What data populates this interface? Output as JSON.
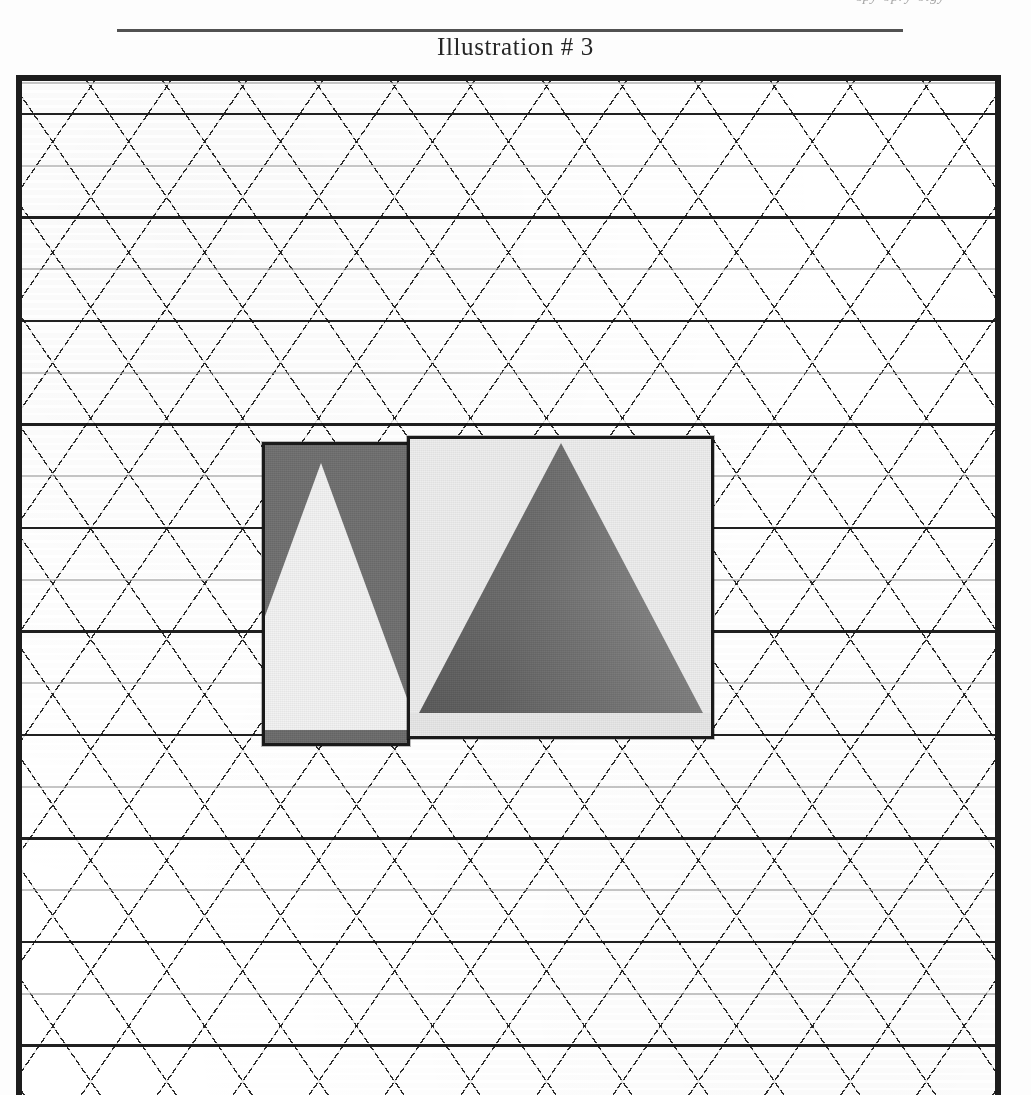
{
  "page": {
    "running_head": "spy-opry-olgy",
    "caption": "Illustration # 3",
    "caption_rule": "horizontal-rule"
  },
  "plate": {
    "name": "framed-illustration-plate",
    "border_color": "#1d1d1d",
    "background_color": "#ffffff",
    "pattern": {
      "type": "diamond-crosshatch-grid",
      "diagonal_line_color": "#1a1a1a",
      "horizontal_dark_line_color": "#141414",
      "horizontal_light_line_color": "#969696",
      "horizontal_dark_spacing_px": 103,
      "horizontal_light_spacing_px": 103,
      "diamond_width_px": 72,
      "diamond_height_px": 103
    }
  },
  "photos": [
    {
      "name": "photo-back-left",
      "description": "dark grey photographic plate with a pale triangular form",
      "ground_color": "#6e6e6e",
      "triangle_color": "#f2f2f2",
      "border_color": "#1a1a1a",
      "x": 240,
      "y": 361,
      "width": 148,
      "height": 304
    },
    {
      "name": "photo-front-right",
      "description": "pale photographic plate with a dark grey pyramid / triangle",
      "ground_color": "#ececec",
      "triangle_color": "#747474",
      "border_color": "#1a1a1a",
      "x": 385,
      "y": 355,
      "width": 307,
      "height": 303
    }
  ],
  "chart_data": {
    "type": "table",
    "title": "Illustration # 3",
    "series": [
      {
        "name": "photo-back-left",
        "values": [
          148,
          304
        ]
      },
      {
        "name": "photo-front-right",
        "values": [
          307,
          303
        ]
      }
    ],
    "categories": [
      "width_px",
      "height_px"
    ]
  }
}
